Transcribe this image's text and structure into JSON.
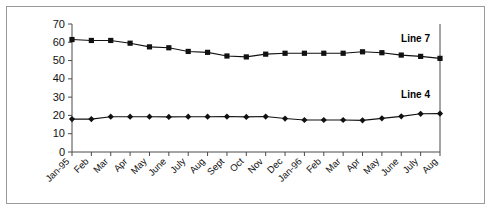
{
  "frame": {
    "top_sliver_text": "",
    "border_color": "#9a9a9a",
    "background": "#ffffff"
  },
  "chart_data": {
    "type": "line",
    "title": "",
    "subtitle": "",
    "xlabel": "",
    "ylabel": "",
    "ylim": [
      0,
      70
    ],
    "ytick_step": 10,
    "yticks": [
      "0",
      "10",
      "20",
      "30",
      "40",
      "50",
      "60",
      "70"
    ],
    "grid": false,
    "legend_position": "inline-right",
    "marker_colors": {
      "line7": "#111111",
      "line4": "#111111"
    },
    "categories": [
      "Jan-95",
      "Feb",
      "Mar",
      "Apr",
      "May",
      "June",
      "July",
      "Aug",
      "Sept",
      "Oct",
      "Nov",
      "Dec",
      "Jan-96",
      "Feb",
      "Mar",
      "Apr",
      "May",
      "June",
      "July",
      "Aug"
    ],
    "series": [
      {
        "name": "Line 7",
        "marker": "square",
        "label": "Line 7",
        "values": [
          61.5,
          61.0,
          61.0,
          59.5,
          57.5,
          57.0,
          55.0,
          54.5,
          52.5,
          52.0,
          53.5,
          54.0,
          54.0,
          54.0,
          54.0,
          54.8,
          54.3,
          53.0,
          52.3,
          51.2
        ]
      },
      {
        "name": "Line 4",
        "marker": "diamond",
        "label": "Line 4",
        "values": [
          18.0,
          18.0,
          19.3,
          19.3,
          19.3,
          19.2,
          19.3,
          19.3,
          19.4,
          19.2,
          19.4,
          18.3,
          17.5,
          17.5,
          17.5,
          17.3,
          18.4,
          19.5,
          20.9,
          21.0
        ]
      }
    ]
  }
}
